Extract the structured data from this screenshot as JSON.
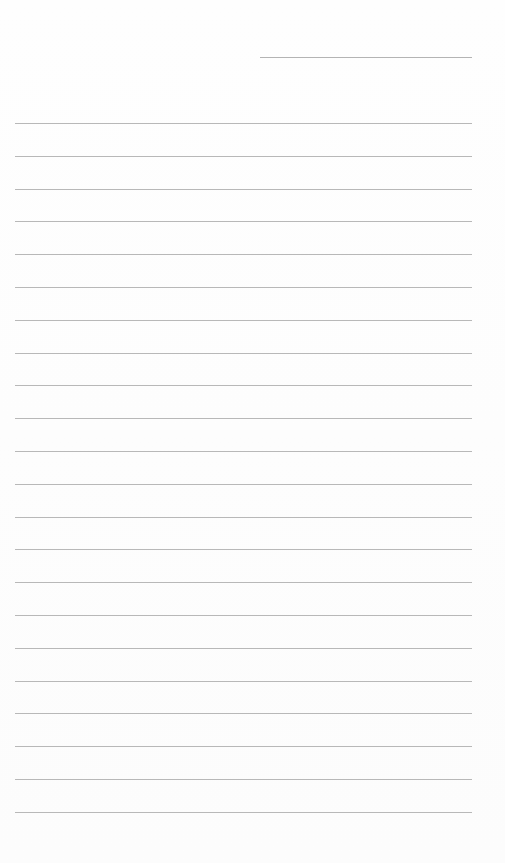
{
  "page": {
    "type": "lined-paper",
    "background_color": "#fdfdfd",
    "rule_color": "#b8b8b8",
    "header_line": {
      "x": 260,
      "y": 57,
      "width": 212
    },
    "rules": {
      "count": 22,
      "start_y": 123,
      "spacing": 32.8,
      "x": 15,
      "width": 457
    }
  }
}
